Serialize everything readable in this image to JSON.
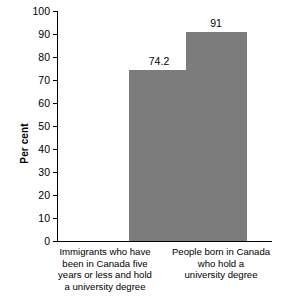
{
  "chart_data": {
    "type": "bar",
    "title": "",
    "subtitle": "",
    "xlabel": "",
    "ylabel": "Per cent",
    "ylim": [
      0,
      100
    ],
    "ytick_step": 10,
    "yticks": [
      0,
      10,
      20,
      30,
      40,
      50,
      60,
      70,
      80,
      90,
      100
    ],
    "grid": false,
    "legend": false,
    "bar_color": "#7c7c7c",
    "axis_color": "#000000",
    "categories": [
      "Immigrants who have\nbeen in Canada five\nyears or less and hold\na university degree",
      "People born in Canada\nwho hold a\nuniversity degree"
    ],
    "values": [
      74.2,
      91
    ],
    "data_labels": [
      "74.2",
      "91"
    ],
    "series": [
      {
        "name": "Per cent",
        "values": [
          74.2,
          91
        ]
      }
    ]
  }
}
